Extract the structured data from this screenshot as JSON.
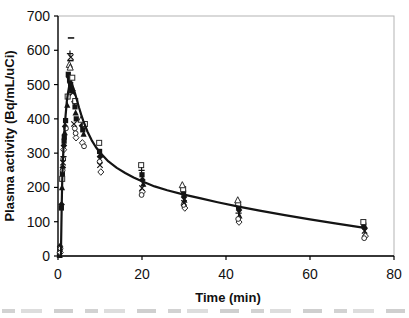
{
  "chart_data": {
    "type": "scatter",
    "title": "",
    "xlabel": "Time (min)",
    "ylabel": "Plasma activity (Bq/mL/uCi)",
    "xlim": [
      0,
      80
    ],
    "ylim": [
      0,
      700
    ],
    "x_ticks": [
      0,
      20,
      40,
      60,
      80
    ],
    "y_ticks": [
      0,
      100,
      200,
      300,
      400,
      500,
      600,
      700
    ],
    "grid": false,
    "legend_position": "none",
    "axis_color": "#000000",
    "frame_color": "#b3b3b3",
    "curve_color": "#141414",
    "marker_fill": "#141414",
    "marker_stroke": "#2a2a2a",
    "fit_curve": {
      "name": "fitted-curve",
      "x": [
        0.7,
        0.8,
        0.9,
        1.0,
        1.15,
        1.3,
        1.5,
        1.8,
        2.1,
        2.4,
        2.7,
        3.0,
        3.3,
        3.6,
        4.0,
        4.5,
        5.0,
        5.5,
        6.0,
        7.0,
        8.0,
        9.0,
        10.0,
        12,
        14,
        16,
        18,
        20,
        23,
        26,
        30,
        34,
        38,
        43,
        48,
        54,
        60,
        66,
        73
      ],
      "y": [
        0,
        90,
        160,
        215,
        270,
        315,
        360,
        410,
        450,
        478,
        496,
        505,
        502,
        492,
        477,
        455,
        433,
        413,
        395,
        363,
        338,
        318,
        302,
        276,
        257,
        242,
        229,
        218,
        203,
        192,
        179,
        168,
        157,
        144,
        132,
        119,
        107,
        95,
        82
      ]
    },
    "series": [
      {
        "name": "filled-square-markers",
        "marker": "filled-square",
        "points": [
          [
            0.35,
            5
          ],
          [
            0.45,
            18
          ],
          [
            0.8,
            140
          ],
          [
            1.05,
            240
          ],
          [
            1.45,
            335
          ],
          [
            1.5,
            347
          ],
          [
            1.8,
            395
          ],
          [
            2.45,
            530
          ],
          [
            2.75,
            514
          ],
          [
            3.0,
            498
          ],
          [
            3.25,
            482
          ],
          [
            4.05,
            435
          ],
          [
            4.35,
            400
          ],
          [
            5.9,
            368
          ],
          [
            9.9,
            305
          ],
          [
            20.0,
            237
          ],
          [
            29.9,
            184
          ],
          [
            43.0,
            143
          ],
          [
            72.8,
            90
          ]
        ]
      },
      {
        "name": "filled-diamond-markers",
        "marker": "filled-diamond",
        "points": [
          [
            0.5,
            28
          ],
          [
            0.85,
            150
          ],
          [
            1.15,
            258
          ],
          [
            1.4,
            322
          ],
          [
            1.7,
            378
          ],
          [
            2.6,
            522
          ],
          [
            2.9,
            505
          ],
          [
            3.1,
            490
          ],
          [
            3.9,
            450
          ],
          [
            5.7,
            380
          ],
          [
            10.0,
            290
          ],
          [
            20.1,
            222
          ],
          [
            30.0,
            172
          ],
          [
            43.1,
            134
          ],
          [
            73.0,
            82
          ]
        ]
      },
      {
        "name": "filled-triangle-markers",
        "marker": "filled-triangle",
        "points": [
          [
            0.4,
            2
          ],
          [
            0.95,
            200
          ],
          [
            1.6,
            360
          ],
          [
            2.2,
            440
          ],
          [
            4.2,
            418
          ],
          [
            6.1,
            356
          ],
          [
            10.1,
            295
          ],
          [
            20.3,
            210
          ],
          [
            30.1,
            163
          ],
          [
            43.2,
            117
          ],
          [
            73.1,
            64
          ]
        ]
      },
      {
        "name": "open-square-markers",
        "marker": "open-square",
        "points": [
          [
            1.0,
            225
          ],
          [
            2.3,
            465
          ],
          [
            3.4,
            520
          ],
          [
            4.1,
            452
          ],
          [
            6.4,
            385
          ],
          [
            9.8,
            330
          ],
          [
            19.8,
            265
          ],
          [
            29.8,
            195
          ],
          [
            42.9,
            152
          ],
          [
            72.7,
            99
          ]
        ]
      },
      {
        "name": "open-diamond-markers",
        "marker": "open-diamond",
        "points": [
          [
            0.55,
            10
          ],
          [
            1.35,
            310
          ],
          [
            4.3,
            345
          ],
          [
            5.8,
            330
          ],
          [
            10.2,
            245
          ],
          [
            20.1,
            187
          ],
          [
            30.2,
            140
          ],
          [
            43.1,
            99
          ],
          [
            73.2,
            58
          ]
        ]
      },
      {
        "name": "open-triangle-markers",
        "marker": "open-triangle",
        "points": [
          [
            2.7,
            558
          ],
          [
            2.9,
            550
          ],
          [
            5.5,
            398
          ],
          [
            29.6,
            207
          ],
          [
            42.8,
            163
          ]
        ]
      },
      {
        "name": "open-circle-markers",
        "marker": "open-circle",
        "points": [
          [
            0.6,
            22
          ],
          [
            1.1,
            250
          ],
          [
            1.25,
            283
          ],
          [
            1.9,
            372
          ],
          [
            4.0,
            372
          ],
          [
            4.2,
            358
          ],
          [
            6.2,
            320
          ],
          [
            9.9,
            275
          ],
          [
            19.9,
            178
          ],
          [
            29.9,
            149
          ],
          [
            42.9,
            108
          ],
          [
            72.9,
            52
          ]
        ]
      },
      {
        "name": "x-cross-markers",
        "marker": "x-cross",
        "points": [
          [
            1.2,
            272
          ],
          [
            3.05,
            580
          ],
          [
            3.5,
            476
          ],
          [
            3.8,
            385
          ],
          [
            10.0,
            265
          ],
          [
            20.0,
            198
          ],
          [
            30.0,
            155
          ],
          [
            73.0,
            73
          ]
        ]
      },
      {
        "name": "plus-markers",
        "marker": "plus",
        "points": [
          [
            1.3,
            290
          ],
          [
            2.85,
            590
          ],
          [
            19.9,
            250
          ],
          [
            43.0,
            125
          ]
        ]
      },
      {
        "name": "dash-markers",
        "marker": "dash",
        "points": [
          [
            3.1,
            636
          ],
          [
            2.95,
            570
          ]
        ]
      }
    ]
  }
}
